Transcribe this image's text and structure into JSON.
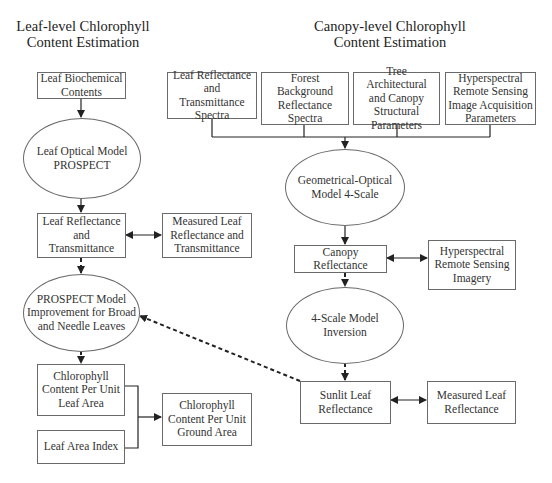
{
  "titles": {
    "leaf_level": "Leaf-level Chlorophyll\nContent Estimation",
    "canopy_level": "Canopy-level Chlorophyll\nContent Estimation"
  },
  "leaf_branch": {
    "biochemical": "Leaf Biochemical\nContents",
    "prospect_model": "Leaf Optical Model\nPROSPECT",
    "leaf_rt": "Leaf Reflectance\nand Transmittance",
    "measured_leaf_rt": "Measured Leaf\nReflectance and\nTransmittance",
    "prospect_improvement": "PROSPECT Model\nImprovement for Broad\nand Needle Leaves",
    "chl_leaf_area": "Chlorophyll\nContent Per Unit\nLeaf Area",
    "lai": "Leaf Area Index",
    "chl_ground_area": "Chlorophyll\nContent Per Unit\nGround Area"
  },
  "canopy_branch": {
    "inputs": [
      "Leaf Reflectance\nand Transmittance\nSpectra",
      "Forest Background\nReflectance\nSpectra",
      "Tree Architectural\nand Canopy\nStructural\nParameters",
      "Hyperspectral\nRemote Sensing\nImage Acquisition\nParameters"
    ],
    "go_model": "Geometrical-Optical\nModel 4-Scale",
    "canopy_reflectance": "Canopy Reflectance",
    "hyperspectral_imagery": "Hyperspectral\nRemote Sensing\nImagery",
    "inversion": "4-Scale Model\nInversion",
    "sunlit_leaf": "Sunlit Leaf\nReflectance",
    "measured_leaf_refl": "Measured Leaf\nReflectance"
  },
  "colors": {
    "line": "#222222",
    "border": "#6a6a6a",
    "text": "#333333"
  }
}
